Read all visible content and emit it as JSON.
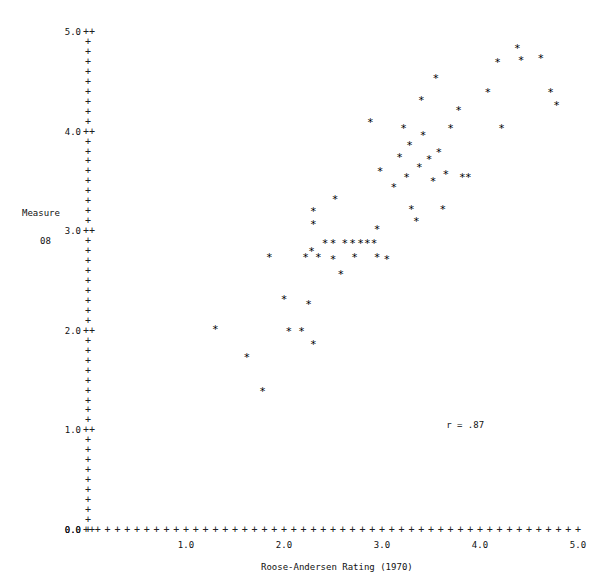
{
  "chart_data": {
    "type": "scatter",
    "title": "",
    "xlabel": "Roose-Andersen Rating (1970)",
    "ylabel_line1": "Measure",
    "ylabel_line2": "08",
    "xlim": [
      0.0,
      5.0
    ],
    "ylim": [
      0.0,
      5.0
    ],
    "xticks": [
      "0.0",
      "1.0",
      "2.0",
      "3.0",
      "4.0",
      "5.0"
    ],
    "xtick_values": [
      0.0,
      1.0,
      2.0,
      3.0,
      4.0,
      5.0
    ],
    "yticks": [
      "0.0",
      "1.0",
      "2.0",
      "3.0",
      "4.0",
      "5.0"
    ],
    "ytick_values": [
      0.0,
      1.0,
      2.0,
      3.0,
      4.0,
      5.0
    ],
    "tick_glyph": "+",
    "marker_glyph": "*",
    "minor_tick_step": 0.1,
    "grid": false,
    "legend": "none",
    "annotation": "r = .87",
    "annotation_x": 3.9,
    "annotation_y": 1.05,
    "marker_color": "#000000",
    "axis_color": "#202020",
    "background_color": "#ffffff",
    "points": [
      [
        1.3,
        2.0
      ],
      [
        1.62,
        1.72
      ],
      [
        1.78,
        1.38
      ],
      [
        1.85,
        2.72
      ],
      [
        2.0,
        2.3
      ],
      [
        2.05,
        1.98
      ],
      [
        2.18,
        1.98
      ],
      [
        2.25,
        2.25
      ],
      [
        2.3,
        1.85
      ],
      [
        2.28,
        2.78
      ],
      [
        2.22,
        2.72
      ],
      [
        2.3,
        3.05
      ],
      [
        2.3,
        3.18
      ],
      [
        2.35,
        2.72
      ],
      [
        2.42,
        2.86
      ],
      [
        2.5,
        2.86
      ],
      [
        2.5,
        2.7
      ],
      [
        2.52,
        3.3
      ],
      [
        2.58,
        2.55
      ],
      [
        2.62,
        2.86
      ],
      [
        2.7,
        2.86
      ],
      [
        2.72,
        2.72
      ],
      [
        2.78,
        2.86
      ],
      [
        2.85,
        2.86
      ],
      [
        2.88,
        4.08
      ],
      [
        2.92,
        2.86
      ],
      [
        2.95,
        3.0
      ],
      [
        2.95,
        2.72
      ],
      [
        2.98,
        3.58
      ],
      [
        3.05,
        2.7
      ],
      [
        3.12,
        3.42
      ],
      [
        3.18,
        3.72
      ],
      [
        3.22,
        4.02
      ],
      [
        3.25,
        3.52
      ],
      [
        3.28,
        3.85
      ],
      [
        3.3,
        3.2
      ],
      [
        3.35,
        3.08
      ],
      [
        3.38,
        3.62
      ],
      [
        3.4,
        4.3
      ],
      [
        3.42,
        3.95
      ],
      [
        3.48,
        3.7
      ],
      [
        3.52,
        3.48
      ],
      [
        3.55,
        4.52
      ],
      [
        3.58,
        3.78
      ],
      [
        3.62,
        3.2
      ],
      [
        3.65,
        3.55
      ],
      [
        3.7,
        4.02
      ],
      [
        3.78,
        4.2
      ],
      [
        3.82,
        3.52
      ],
      [
        3.88,
        3.52
      ],
      [
        4.08,
        4.38
      ],
      [
        4.18,
        4.68
      ],
      [
        4.22,
        4.02
      ],
      [
        4.38,
        4.82
      ],
      [
        4.42,
        4.7
      ],
      [
        4.62,
        4.72
      ],
      [
        4.72,
        4.38
      ],
      [
        4.78,
        4.25
      ]
    ]
  },
  "geometry": {
    "origin_x": 88,
    "origin_y": 530,
    "px_per_unit_x": 98.0,
    "px_per_unit_y": 99.6
  }
}
